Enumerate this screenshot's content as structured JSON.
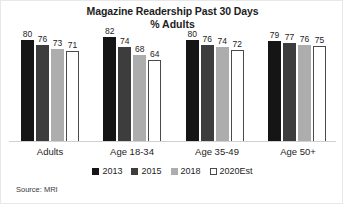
{
  "chart_data": {
    "type": "bar",
    "title": "Magazine Readership Past 30 Days",
    "subtitle": "% Adults",
    "xlabel": "",
    "ylabel": "",
    "ylim": [
      0,
      100
    ],
    "grid": false,
    "legend_position": "bottom",
    "categories": [
      "Adults",
      "Age 18-34",
      "Age 35-49",
      "Age 50+"
    ],
    "series": [
      {
        "name": "2013",
        "color": "#151515",
        "values": [
          80,
          82,
          80,
          79
        ]
      },
      {
        "name": "2015",
        "color": "#3d3d3d",
        "values": [
          76,
          74,
          76,
          77
        ]
      },
      {
        "name": "2018",
        "color": "#adadad",
        "values": [
          73,
          68,
          74,
          76
        ]
      },
      {
        "name": "2020Est",
        "color": "#ffffff",
        "values": [
          71,
          64,
          72,
          75
        ]
      }
    ],
    "source": "Source: MRI"
  },
  "groups": [
    {
      "label": "Adults",
      "bars": [
        {
          "series": "2013",
          "value": "80"
        },
        {
          "series": "2015",
          "value": "76"
        },
        {
          "series": "2018",
          "value": "73"
        },
        {
          "series": "2020Est",
          "value": "71"
        }
      ]
    },
    {
      "label": "Age 18-34",
      "bars": [
        {
          "series": "2013",
          "value": "82"
        },
        {
          "series": "2015",
          "value": "74"
        },
        {
          "series": "2018",
          "value": "68"
        },
        {
          "series": "2020Est",
          "value": "64"
        }
      ]
    },
    {
      "label": "Age 35-49",
      "bars": [
        {
          "series": "2013",
          "value": "80"
        },
        {
          "series": "2015",
          "value": "76"
        },
        {
          "series": "2018",
          "value": "74"
        },
        {
          "series": "2020Est",
          "value": "72"
        }
      ]
    },
    {
      "label": "Age 50+",
      "bars": [
        {
          "series": "2013",
          "value": "79"
        },
        {
          "series": "2015",
          "value": "77"
        },
        {
          "series": "2018",
          "value": "76"
        },
        {
          "series": "2020Est",
          "value": "75"
        }
      ]
    }
  ],
  "legend": {
    "items": [
      {
        "label": "2013",
        "color": "#151515"
      },
      {
        "label": "2015",
        "color": "#3d3d3d"
      },
      {
        "label": "2018",
        "color": "#adadad"
      },
      {
        "label": "2020Est",
        "color": "#ffffff"
      }
    ]
  },
  "footer": {
    "source": "Source: MRI"
  }
}
